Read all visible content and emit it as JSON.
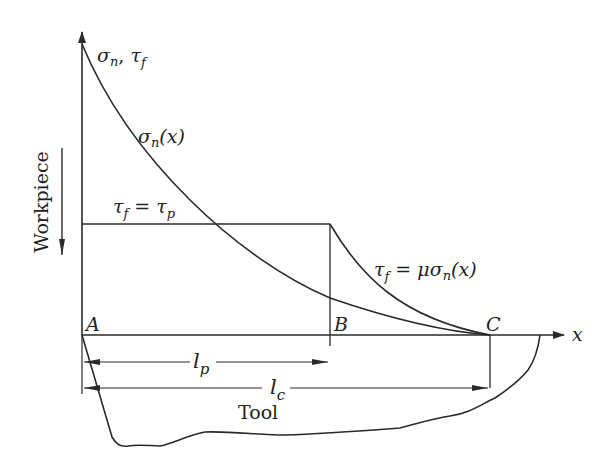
{
  "diagram": {
    "y_axis_label": {
      "sigma": "σ",
      "sigma_sub": "n",
      "sep": ", ",
      "tau": "τ",
      "tau_sub": "f"
    },
    "x_axis_label": "x",
    "workpiece_label": "Workpiece",
    "tool_label": "Tool",
    "points": {
      "A": "A",
      "B": "B",
      "C": "C"
    },
    "curves": {
      "sigma_n": {
        "sym": "σ",
        "sub": "n",
        "arg": "(x)"
      },
      "tau_plateau": {
        "lhs": "τ",
        "lhs_sub": "f",
        "eq": " = ",
        "rhs": "τ",
        "rhs_sub": "p"
      },
      "tau_friction": {
        "lhs": "τ",
        "lhs_sub": "f",
        "eq": " = ",
        "mu": "μ",
        "sym": "σ",
        "sub": "n",
        "arg": "(x)"
      }
    },
    "dimensions": {
      "lp": {
        "l": "l",
        "sub": "p"
      },
      "lc": {
        "l": "l",
        "sub": "c"
      }
    },
    "colors": {
      "line": "#2a2a2a",
      "text": "#222222",
      "background": "#ffffff"
    }
  }
}
